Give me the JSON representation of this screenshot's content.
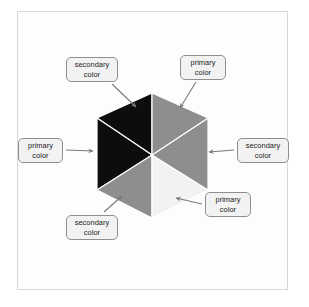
{
  "figure": {
    "panel_background": "#fdfdfd",
    "panel_border_color": "#d8d8d8",
    "page_background": "#ffffff"
  },
  "cube": {
    "description": "isometric cube drawn as a hexagon divided into six wedges",
    "center": {
      "x": 152,
      "y": 155
    },
    "vertices": {
      "top": {
        "x": 152,
        "y": 93
      },
      "upper_right": {
        "x": 208,
        "y": 118
      },
      "lower_right": {
        "x": 208,
        "y": 190
      },
      "bottom": {
        "x": 152,
        "y": 218
      },
      "lower_left": {
        "x": 97,
        "y": 190
      },
      "upper_left": {
        "x": 97,
        "y": 118
      }
    },
    "wedges": [
      {
        "name": "top-left-wedge",
        "role": "secondary color",
        "fill": "#0d0d0d"
      },
      {
        "name": "top-right-wedge",
        "role": "primary color",
        "fill": "#8e8e8e"
      },
      {
        "name": "right-wedge",
        "role": "secondary color",
        "fill": "#8e8e8e"
      },
      {
        "name": "bottom-right-wedge",
        "role": "primary color",
        "fill": "#f2f2f2"
      },
      {
        "name": "bottom-left-wedge",
        "role": "secondary color",
        "fill": "#8e8e8e"
      },
      {
        "name": "left-wedge",
        "role": "primary color",
        "fill": "#0d0d0d"
      }
    ],
    "edge_color": "#ffffff"
  },
  "callouts": [
    {
      "id": "top-left",
      "text": "secondary\ncolor",
      "arrow": {
        "from": {
          "x": 112,
          "y": 84
        },
        "to": {
          "x": 136,
          "y": 107
        }
      }
    },
    {
      "id": "top-right",
      "text": "primary\ncolor",
      "arrow": {
        "from": {
          "x": 196,
          "y": 82
        },
        "to": {
          "x": 180,
          "y": 108
        }
      }
    },
    {
      "id": "left",
      "text": "primary\ncolor",
      "arrow": {
        "from": {
          "x": 66,
          "y": 150
        },
        "to": {
          "x": 93,
          "y": 151
        }
      }
    },
    {
      "id": "right",
      "text": "secondary\ncolor",
      "arrow": {
        "from": {
          "x": 234,
          "y": 150
        },
        "to": {
          "x": 209,
          "y": 152
        }
      }
    },
    {
      "id": "bottom-left",
      "text": "secondary\ncolor",
      "arrow": {
        "from": {
          "x": 104,
          "y": 212
        },
        "to": {
          "x": 122,
          "y": 196
        }
      }
    },
    {
      "id": "bottom-right",
      "text": "primary\ncolor",
      "arrow": {
        "from": {
          "x": 202,
          "y": 204
        },
        "to": {
          "x": 176,
          "y": 198
        }
      }
    }
  ],
  "styles": {
    "callout_fill": "#f2f2f2",
    "callout_border": "#8f8f8f",
    "callout_text_color": "#1a1a1a",
    "arrow_color": "#7a7a7a"
  }
}
